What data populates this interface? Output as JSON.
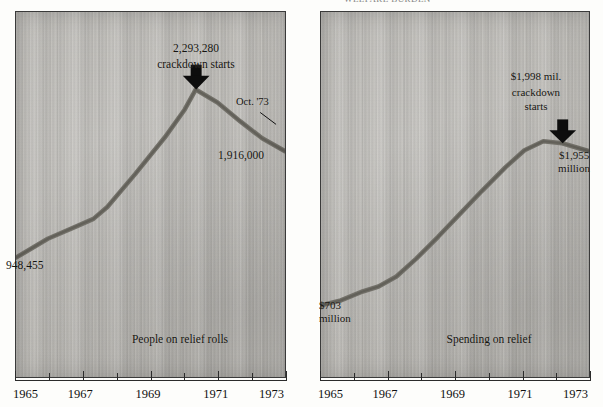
{
  "figure": {
    "cut_off_header": "WELFARE BURDEN",
    "panels": [
      {
        "id": "left",
        "caption": "People on relief rolls",
        "peak_value_label": "2,293,280",
        "peak_note": "crackdown starts",
        "annotation_right": "Oct. '73",
        "end_value_label": "1,916,000",
        "start_value_label": "948,455",
        "arrow": "down-arrow-icon"
      },
      {
        "id": "right",
        "caption": "Spending on relief",
        "peak_value_label": "$1,998 mil.",
        "peak_note_line1": "crackdown",
        "peak_note_line2": "starts",
        "end_value_line1": "$1,955",
        "end_value_line2": "million",
        "start_value_line1": "$703",
        "start_value_line2": "million",
        "arrow": "down-arrow-icon"
      }
    ],
    "axis": {
      "labels": [
        "1965",
        "1967",
        "1969",
        "1971",
        "1973"
      ],
      "minor_ticks": [
        "1966",
        "1968",
        "1970",
        "1972"
      ],
      "range": [
        1965,
        1973
      ]
    },
    "colors": {
      "line": "#6d6a63",
      "arrow": "#0d0d0d",
      "paper": "#bcbab5",
      "ink": "#15140f"
    }
  },
  "chart_data": [
    {
      "type": "line",
      "title": "People on relief rolls",
      "xlabel": "",
      "ylabel": "People on relief rolls",
      "x": [
        1965,
        1966,
        1967,
        1968,
        1969,
        1970.6,
        1971.4,
        1972.2,
        1973.0
      ],
      "values": [
        948455,
        1100000,
        1250000,
        1500000,
        1800000,
        2293280,
        2150000,
        2020000,
        1916000
      ],
      "xlim": [
        1965,
        1973
      ],
      "ylim": [
        0,
        2600000
      ],
      "annotations": [
        {
          "text": "948,455",
          "x": 1965,
          "y": 948455
        },
        {
          "text": "2,293,280 crackdown starts",
          "x": 1970.6,
          "y": 2293280
        },
        {
          "text": "Oct. '73",
          "x": 1973,
          "y": 2100000
        },
        {
          "text": "1,916,000",
          "x": 1973,
          "y": 1916000
        }
      ],
      "grid": false,
      "legend": "none"
    },
    {
      "type": "line",
      "title": "Spending on relief",
      "xlabel": "",
      "ylabel": "Spending on relief (millions of dollars)",
      "x": [
        1965,
        1966,
        1966.6,
        1967.6,
        1968.6,
        1969.6,
        1970.6,
        1971.4,
        1972.2,
        1973.0
      ],
      "values": [
        703,
        760,
        830,
        1000,
        1200,
        1430,
        1700,
        1900,
        1998,
        1955
      ],
      "xlim": [
        1965,
        1973
      ],
      "ylim": [
        0,
        2400
      ],
      "annotations": [
        {
          "text": "$703 million",
          "x": 1965,
          "y": 703
        },
        {
          "text": "$1,998 mil. crackdown starts",
          "x": 1972.2,
          "y": 1998
        },
        {
          "text": "$1,955 million",
          "x": 1973,
          "y": 1955
        }
      ],
      "grid": false,
      "legend": "none"
    }
  ]
}
